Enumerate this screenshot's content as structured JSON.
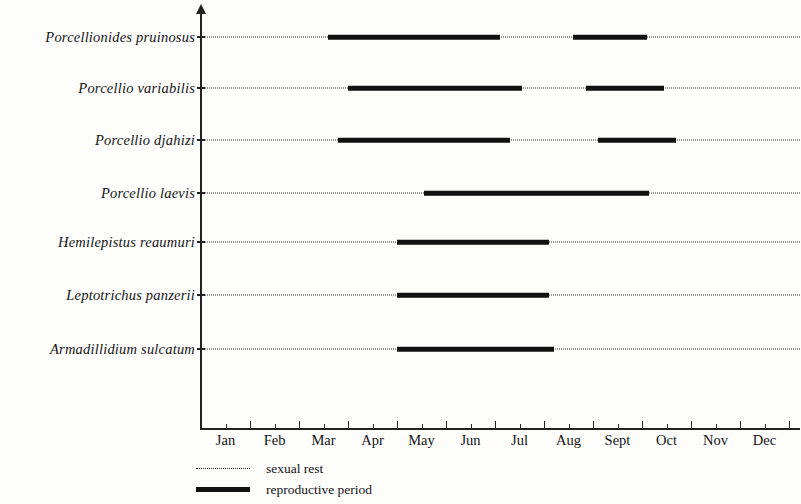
{
  "chart_data": {
    "type": "bar",
    "chart_kind": "gantt-timeline",
    "title": "",
    "subtitle": "",
    "xlabel": "",
    "ylabel": "",
    "grid": false,
    "legend_position": "bottom-left",
    "x_axis": {
      "unit": "month",
      "tick_labels": [
        "Jan",
        "Feb",
        "Mar",
        "Apr",
        "May",
        "Jun",
        "Jul",
        "Aug",
        "Sept",
        "Oct",
        "Nov",
        "Dec"
      ],
      "minor_ticks_per_month": 2,
      "xlim": [
        0,
        12
      ]
    },
    "categories": [
      "Porcellionides pruinosus",
      "Porcellio variabilis",
      "Porcellio djahizi",
      "Porcellio laevis",
      "Hemilepistus reaumuri",
      "Leptotrichus panzerii",
      "Armadillidium sulcatum"
    ],
    "series": [
      {
        "name": "sexual rest",
        "style": "dotted",
        "color": "#333333",
        "spans": [
          {
            "category": "Porcellionides pruinosus",
            "start_month": 0.0,
            "end_month": 12.0
          },
          {
            "category": "Porcellio variabilis",
            "start_month": 0.0,
            "end_month": 12.0
          },
          {
            "category": "Porcellio djahizi",
            "start_month": 0.0,
            "end_month": 12.0
          },
          {
            "category": "Porcellio laevis",
            "start_month": 0.0,
            "end_month": 12.0
          },
          {
            "category": "Hemilepistus reaumuri",
            "start_month": 0.0,
            "end_month": 12.0
          },
          {
            "category": "Leptotrichus panzerii",
            "start_month": 0.0,
            "end_month": 12.0
          },
          {
            "category": "Armadillidium sulcatum",
            "start_month": 0.0,
            "end_month": 12.0
          }
        ]
      },
      {
        "name": "reproductive period",
        "style": "solid-thick",
        "color": "#111111",
        "spans": [
          {
            "category": "Porcellionides pruinosus",
            "start_month": 2.6,
            "end_month": 6.1
          },
          {
            "category": "Porcellionides pruinosus",
            "start_month": 7.6,
            "end_month": 9.1
          },
          {
            "category": "Porcellio variabilis",
            "start_month": 3.0,
            "end_month": 6.55
          },
          {
            "category": "Porcellio variabilis",
            "start_month": 7.85,
            "end_month": 9.45
          },
          {
            "category": "Porcellio djahizi",
            "start_month": 2.8,
            "end_month": 6.3
          },
          {
            "category": "Porcellio djahizi",
            "start_month": 8.1,
            "end_month": 9.7
          },
          {
            "category": "Porcellio laevis",
            "start_month": 4.55,
            "end_month": 9.15
          },
          {
            "category": "Hemilepistus reaumuri",
            "start_month": 4.0,
            "end_month": 7.1
          },
          {
            "category": "Leptotrichus panzerii",
            "start_month": 4.0,
            "end_month": 7.1
          },
          {
            "category": "Armadillidium sulcatum",
            "start_month": 4.0,
            "end_month": 7.2
          }
        ]
      }
    ]
  },
  "species": [
    {
      "label": "Porcellionides pruinosus"
    },
    {
      "label": "Porcellio variabilis"
    },
    {
      "label": "Porcellio djahizi"
    },
    {
      "label": "Porcellio laevis"
    },
    {
      "label": "Hemilepistus reaumuri"
    },
    {
      "label": "Leptotrichus panzerii"
    },
    {
      "label": "Armadillidium sulcatum"
    }
  ],
  "months": [
    "Jan",
    "Feb",
    "Mar",
    "Apr",
    "May",
    "Jun",
    "Jul",
    "Aug",
    "Sept",
    "Oct",
    "Nov",
    "Dec"
  ],
  "legend": {
    "items": [
      {
        "label": "sexual rest",
        "style": "dotted"
      },
      {
        "label": "reproductive period",
        "style": "solid"
      }
    ]
  },
  "colors": {
    "ink": "#111111",
    "axis": "#222222",
    "dotted": "#333333",
    "background": "#fdfdfc"
  }
}
